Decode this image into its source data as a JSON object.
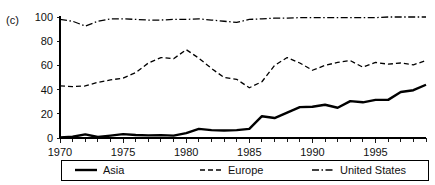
{
  "panel": {
    "label": "(c)"
  },
  "chart_data": {
    "type": "line",
    "title": "",
    "xlabel": "",
    "ylabel": "",
    "xlim": [
      1970,
      1999
    ],
    "ylim": [
      0,
      100
    ],
    "yticks": [
      0,
      20,
      40,
      60,
      80,
      100
    ],
    "xticks": [
      1970,
      1975,
      1980,
      1985,
      1990,
      1995
    ],
    "xtick_labels": [
      "1970",
      "1975",
      "1980",
      "1985",
      "1990",
      "1995"
    ],
    "ytick_labels": [
      "0",
      "20",
      "40",
      "60",
      "80",
      "100"
    ],
    "minor_xticks_every": 1,
    "grid": false,
    "legend_position": "bottom",
    "x": [
      1970,
      1971,
      1972,
      1973,
      1974,
      1975,
      1976,
      1977,
      1978,
      1979,
      1980,
      1981,
      1982,
      1983,
      1984,
      1985,
      1986,
      1987,
      1988,
      1989,
      1990,
      1991,
      1992,
      1993,
      1994,
      1995,
      1996,
      1997,
      1998,
      1999
    ],
    "series": [
      {
        "name": "Asia",
        "style": "solid",
        "width": 2.4,
        "color": "#000000",
        "values": [
          0.5,
          1.0,
          3.0,
          0.8,
          2.0,
          3.2,
          2.5,
          2.2,
          2.4,
          2.0,
          4.0,
          7.5,
          6.5,
          6.2,
          6.5,
          7.5,
          18.0,
          16.5,
          21.0,
          25.5,
          25.8,
          27.5,
          25.0,
          30.5,
          29.5,
          31.5,
          31.5,
          38.0,
          39.5,
          44.0
        ]
      },
      {
        "name": "Europe",
        "style": "dashed",
        "width": 1.3,
        "color": "#000000",
        "values": [
          43.0,
          42.5,
          43.0,
          46.0,
          48.0,
          49.5,
          54.0,
          62.0,
          66.5,
          65.5,
          73.0,
          66.0,
          57.5,
          50.0,
          48.5,
          41.5,
          46.5,
          60.0,
          66.5,
          62.0,
          56.0,
          60.0,
          62.5,
          64.0,
          58.5,
          62.5,
          61.0,
          62.0,
          60.5,
          64.0
        ]
      },
      {
        "name": "United States",
        "style": "dashdot",
        "width": 1.3,
        "color": "#000000",
        "values": [
          98.0,
          96.5,
          92.5,
          96.5,
          98.5,
          98.5,
          98.0,
          97.5,
          97.5,
          98.0,
          98.0,
          98.5,
          97.5,
          96.5,
          95.5,
          98.0,
          98.5,
          99.0,
          99.0,
          99.5,
          99.5,
          99.5,
          99.5,
          99.5,
          99.5,
          99.5,
          100.0,
          100.0,
          100.0,
          100.0
        ]
      }
    ]
  },
  "legend": {
    "items": [
      {
        "label": "Asia",
        "style": "solid"
      },
      {
        "label": "Europe",
        "style": "dashed"
      },
      {
        "label": "United States",
        "style": "dashdot"
      }
    ]
  }
}
